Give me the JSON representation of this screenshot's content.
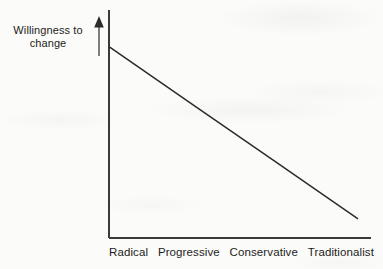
{
  "chart_data": {
    "type": "line",
    "title": "",
    "subtitle": "",
    "xlabel": "",
    "ylabel": "Willingness to change",
    "ylabel_lines": [
      "Willingness to",
      "change"
    ],
    "categories": [
      "Radical",
      "Progressive",
      "Conservative",
      "Traditionalist"
    ],
    "series": [
      {
        "name": "Willingness to change",
        "values": [
          100,
          70,
          40,
          10
        ]
      }
    ],
    "x": [
      0,
      1,
      2,
      3
    ],
    "xlim": [
      0,
      3
    ],
    "ylim": [
      0,
      115
    ],
    "grid": false,
    "legend": false,
    "legend_position": "none",
    "annotations": [
      {
        "name": "y-axis-direction-arrow",
        "icon": "up-arrow-icon",
        "meaning": "increasing willingness to change"
      }
    ],
    "axis_ticks_visible": false
  },
  "style": {
    "line_color": "#2b2b2b",
    "axis_color": "#3a3a3a",
    "text_color": "#1b1b1b",
    "background_color": "#fbfbf9"
  },
  "geometry": {
    "y_axis_x": 109,
    "y_axis_top": 10,
    "x_axis_y": 238,
    "x_axis_right": 371,
    "line_start": [
      109,
      46
    ],
    "line_end": [
      358,
      214
    ],
    "arrow_x": 99,
    "arrow_top": 18,
    "arrow_bottom": 56
  }
}
